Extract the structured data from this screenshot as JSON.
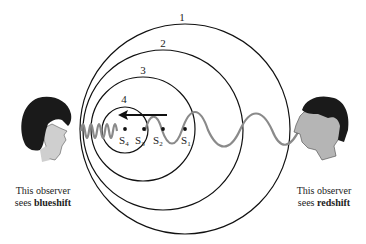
{
  "diagram": {
    "wavefronts": [
      {
        "label": "1",
        "cx": 185,
        "cy": 129,
        "r": 105
      },
      {
        "label": "2",
        "cx": 163,
        "cy": 130,
        "r": 80
      },
      {
        "label": "3",
        "cx": 143,
        "cy": 129,
        "r": 52
      },
      {
        "label": "4",
        "cx": 125,
        "cy": 130,
        "r": 23
      }
    ],
    "source_positions": [
      {
        "label": "S",
        "sub": "1",
        "x": 185,
        "y": 129
      },
      {
        "label": "S",
        "sub": "2",
        "x": 163,
        "y": 129
      },
      {
        "label": "S",
        "sub": "3",
        "x": 143,
        "y": 129
      },
      {
        "label": "S",
        "sub": "4",
        "x": 125,
        "y": 129
      }
    ],
    "motion_arrow": {
      "direction": "left"
    },
    "wave_color": "#8a8a8a"
  },
  "observers": {
    "left": {
      "line1": "This observer",
      "line2_prefix": "sees ",
      "line2_bold": "blueshift",
      "icon": "woman-profile-icon"
    },
    "right": {
      "line1": "This observer",
      "line2_prefix": "sees ",
      "line2_bold": "redshift",
      "icon": "man-profile-icon"
    }
  }
}
